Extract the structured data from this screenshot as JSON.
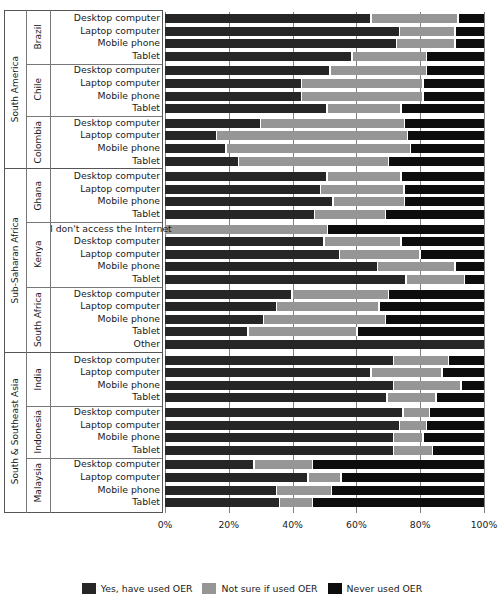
{
  "chart_data": {
    "type": "bar",
    "subtype": "stacked-horizontal-100pct",
    "title": "",
    "xlabel": "",
    "ylabel": "",
    "xlim": [
      0,
      100
    ],
    "grid": true,
    "legend_position": "bottom-center",
    "xticks": [
      "0%",
      "20%",
      "40%",
      "60%",
      "80%",
      "100%"
    ],
    "xtick_values": [
      0,
      20,
      40,
      60,
      80,
      100
    ],
    "series": [
      {
        "name": "Yes, have used OER",
        "color": "#262626"
      },
      {
        "name": "Not sure if used OER",
        "color": "#969696"
      },
      {
        "name": "Never used OER",
        "color": "#0d0d0d"
      }
    ],
    "regions": [
      {
        "label": "South America",
        "countries": [
          {
            "label": "Brazil",
            "rows": [
              {
                "category": "Desktop computer",
                "values": [
                  65,
                  27,
                  8
                ]
              },
              {
                "category": "Laptop computer",
                "values": [
                  74,
                  17,
                  9
                ]
              },
              {
                "category": "Mobile phone",
                "values": [
                  73,
                  18,
                  9
                ]
              },
              {
                "category": "Tablet",
                "values": [
                  59,
                  23,
                  18
                ]
              }
            ]
          },
          {
            "label": "Chile",
            "rows": [
              {
                "category": "Desktop computer",
                "values": [
                  52,
                  30,
                  18
                ]
              },
              {
                "category": "Laptop computer",
                "values": [
                  43,
                  38,
                  19
                ]
              },
              {
                "category": "Mobile phone",
                "values": [
                  43,
                  38,
                  19
                ]
              },
              {
                "category": "Tablet",
                "values": [
                  51,
                  23,
                  26
                ]
              }
            ]
          },
          {
            "label": "Colombia",
            "rows": [
              {
                "category": "Desktop computer",
                "values": [
                  30,
                  45,
                  25
                ]
              },
              {
                "category": "Laptop computer",
                "values": [
                  16,
                  60,
                  24
                ]
              },
              {
                "category": "Mobile phone",
                "values": [
                  19,
                  58,
                  23
                ]
              },
              {
                "category": "Tablet",
                "values": [
                  23,
                  47,
                  30
                ]
              }
            ]
          }
        ]
      },
      {
        "label": "Sub-Saharan Africa",
        "countries": [
          {
            "label": "Ghana",
            "rows": [
              {
                "category": "Desktop computer",
                "values": [
                  51,
                  23,
                  26
                ]
              },
              {
                "category": "Laptop computer",
                "values": [
                  49,
                  26,
                  25
                ]
              },
              {
                "category": "Mobile phone",
                "values": [
                  53,
                  22,
                  25
                ]
              },
              {
                "category": "Tablet",
                "values": [
                  47,
                  22,
                  31
                ]
              }
            ]
          },
          {
            "label": "Kenya",
            "rows": [
              {
                "category": "I don't access the Internet",
                "values": [
                  0,
                  51,
                  49
                ]
              },
              {
                "category": "Desktop computer",
                "values": [
                  50,
                  24,
                  26
                ]
              },
              {
                "category": "Laptop computer",
                "values": [
                  55,
                  25,
                  20
                ]
              },
              {
                "category": "Mobile phone",
                "values": [
                  67,
                  24,
                  9
                ]
              },
              {
                "category": "Tablet",
                "values": [
                  76,
                  18,
                  6
                ]
              }
            ]
          },
          {
            "label": "South Africa",
            "rows": [
              {
                "category": "Desktop computer",
                "values": [
                  40,
                  30,
                  30
                ]
              },
              {
                "category": "Laptop computer",
                "values": [
                  35,
                  32,
                  33
                ]
              },
              {
                "category": "Mobile phone",
                "values": [
                  31,
                  38,
                  31
                ]
              },
              {
                "category": "Tablet",
                "values": [
                  26,
                  34,
                  40
                ]
              },
              {
                "category": "Other",
                "values": [
                  100,
                  0,
                  0
                ]
              }
            ]
          }
        ]
      },
      {
        "label": "South & Southeast Asia",
        "countries": [
          {
            "label": "India",
            "rows": [
              {
                "category": "Desktop computer",
                "values": [
                  72,
                  17,
                  11
                ]
              },
              {
                "category": "Laptop computer",
                "values": [
                  65,
                  22,
                  13
                ]
              },
              {
                "category": "Mobile phone",
                "values": [
                  72,
                  21,
                  7
                ]
              },
              {
                "category": "Tablet",
                "values": [
                  70,
                  15,
                  15
                ]
              }
            ]
          },
          {
            "label": "Indonesia",
            "rows": [
              {
                "category": "Desktop computer",
                "values": [
                  75,
                  8,
                  17
                ]
              },
              {
                "category": "Laptop computer",
                "values": [
                  74,
                  8,
                  18
                ]
              },
              {
                "category": "Mobile phone",
                "values": [
                  72,
                  9,
                  19
                ]
              },
              {
                "category": "Tablet",
                "values": [
                  72,
                  12,
                  16
                ]
              }
            ]
          },
          {
            "label": "Malaysia",
            "rows": [
              {
                "category": "Desktop computer",
                "values": [
                  28,
                  18,
                  54
                ]
              },
              {
                "category": "Laptop computer",
                "values": [
                  45,
                  10,
                  45
                ]
              },
              {
                "category": "Mobile phone",
                "values": [
                  35,
                  17,
                  48
                ]
              },
              {
                "category": "Tablet",
                "values": [
                  36,
                  10,
                  54
                ]
              }
            ]
          }
        ]
      }
    ]
  }
}
